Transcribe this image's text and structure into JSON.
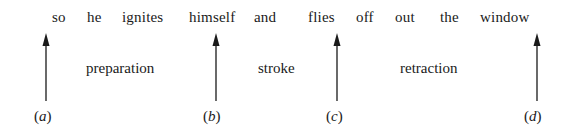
{
  "figure": {
    "utterance_words": [
      {
        "text": "so",
        "x": 52
      },
      {
        "text": "he",
        "x": 87
      },
      {
        "text": "ignites",
        "x": 122
      },
      {
        "text": "himself",
        "x": 189
      },
      {
        "text": "and",
        "x": 254
      },
      {
        "text": "flies",
        "x": 308
      },
      {
        "text": "off",
        "x": 356
      },
      {
        "text": "out",
        "x": 395
      },
      {
        "text": "the",
        "x": 440
      },
      {
        "text": "window",
        "x": 480
      }
    ],
    "phases": [
      {
        "label": "preparation",
        "x": 86
      },
      {
        "label": "stroke",
        "x": 258
      },
      {
        "label": "retraction",
        "x": 400
      }
    ],
    "markers": [
      {
        "letter": "a",
        "x": 46,
        "label_x": 34
      },
      {
        "letter": "b",
        "x": 216,
        "label_x": 203
      },
      {
        "letter": "c",
        "x": 337,
        "label_x": 326
      },
      {
        "letter": "d",
        "x": 537,
        "label_x": 524
      }
    ]
  }
}
